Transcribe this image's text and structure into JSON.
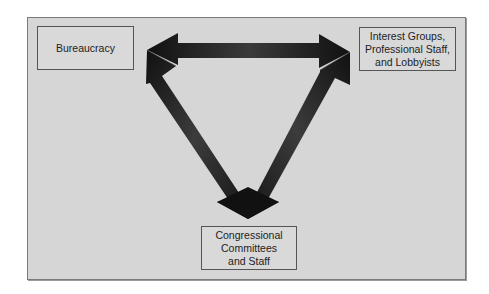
{
  "diagram": {
    "nodes": [
      {
        "id": "bureaucracy",
        "label": "Bureaucracy"
      },
      {
        "id": "interest",
        "label": "Interest Groups,\nProfessional Staff,\nand Lobbyists"
      },
      {
        "id": "congress",
        "label": "Congressional\nCommittees\nand Staff"
      }
    ],
    "edges": [
      {
        "from": "bureaucracy",
        "to": "interest",
        "type": "bidirectional-arrow"
      },
      {
        "from": "bureaucracy",
        "to": "congress",
        "type": "bidirectional-arrow"
      },
      {
        "from": "interest",
        "to": "congress",
        "type": "bidirectional-arrow"
      }
    ],
    "colors": {
      "background": "#d6d6d6",
      "arrow": "#1a1a1a",
      "box_border": "#555555"
    }
  }
}
